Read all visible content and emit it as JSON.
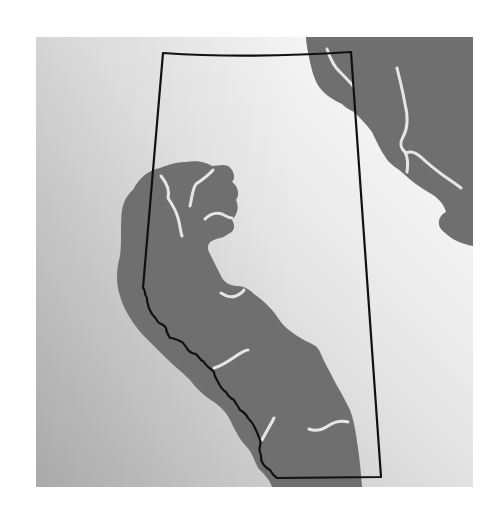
{
  "map": {
    "title": "",
    "subject": "Province outline with shaded region",
    "colors": {
      "page_background": "#ffffff",
      "panel_light": "#f2f2f2",
      "panel_dark": "#b9b9b9",
      "region_fill": "#6f6f6f",
      "river_stroke": "#e6e6e6",
      "boundary_stroke": "#111111"
    },
    "panel": {
      "x": 36,
      "y": 37,
      "width": 437,
      "height": 450
    },
    "features": [
      {
        "name": "province-boundary",
        "type": "outline"
      },
      {
        "name": "shaded-region-southwest",
        "type": "area"
      },
      {
        "name": "shaded-region-northeast",
        "type": "area"
      },
      {
        "name": "rivers",
        "type": "lines"
      }
    ]
  }
}
